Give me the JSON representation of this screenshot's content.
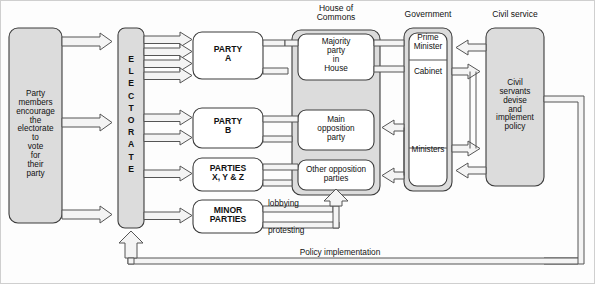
{
  "diagram": {
    "title_visible": false,
    "colors": {
      "box_fill_gray": "#dcdcdc",
      "box_fill_white": "#ffffff",
      "stroke": "#3c3c3c",
      "arrow_fill": "#f2f2f2",
      "page_bg": "#fdfdfd",
      "text": "#111111"
    },
    "group_headers": [
      {
        "id": "house-of-commons",
        "label": "House of\nCommons",
        "line1": "House of",
        "line2": "Commons"
      },
      {
        "id": "government",
        "label": "Government"
      },
      {
        "id": "civil-service",
        "label": "Civil service"
      }
    ],
    "nodes": {
      "party_members": {
        "label": "Party\nmembers\nencourage\nthe\nelectorate\nto\nvote\nfor their\nparty",
        "lines": [
          "Party",
          "members",
          "encourage",
          "the",
          "electorate",
          "to",
          "vote",
          "for",
          "their",
          "party"
        ]
      },
      "electorate": {
        "label": "ELECTORATE",
        "letters": [
          "E",
          "L",
          "E",
          "C",
          "T",
          "O",
          "R",
          "A",
          "T",
          "E"
        ]
      },
      "party_a": {
        "line1": "PARTY",
        "line2": "A"
      },
      "party_b": {
        "line1": "PARTY",
        "line2": "B"
      },
      "parties_xyz": {
        "line1": "PARTIES",
        "line2": "X, Y & Z"
      },
      "minor_parties": {
        "line1": "MINOR",
        "line2": "PARTIES"
      },
      "majority_party": {
        "lines": [
          "Majority",
          "party",
          "in",
          "House"
        ]
      },
      "main_opposition": {
        "lines": [
          "Main",
          "opposition",
          "party"
        ]
      },
      "other_opposition": {
        "lines": [
          "Other opposition",
          "parties"
        ]
      },
      "prime_minister": {
        "lines": [
          "Prime",
          "Minister"
        ]
      },
      "cabinet": {
        "label": "Cabinet"
      },
      "ministers": {
        "label": "Ministers"
      },
      "civil_servants": {
        "lines": [
          "Civil",
          "servants",
          "devise",
          "and",
          "implement",
          "policy"
        ]
      }
    },
    "edge_labels": {
      "lobbying": "lobbying",
      "protesting": "protesting",
      "policy_implementation": "Policy implementation"
    },
    "arrow_counts": {
      "electorate_to_party_a": 4,
      "electorate_to_party_b": 2,
      "electorate_to_parties_xyz": 1,
      "electorate_to_minor_parties": 1,
      "members_to_electorate": 3
    }
  }
}
